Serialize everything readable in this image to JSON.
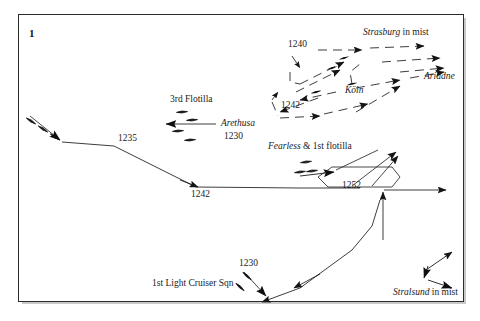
{
  "figure": {
    "panel_number": "1",
    "kind": "naval-track-chart",
    "background_color": "#ffffff",
    "ink_color": "#1a1a1a",
    "frame_color": "#2b2b2b"
  },
  "labels": [
    {
      "name": "label-1240",
      "text": "1240",
      "style": "time",
      "x": 288,
      "y": 44
    },
    {
      "name": "label-strasburg",
      "text": "Strasburg",
      "style": "ital",
      "x": 363,
      "y": 33,
      "suffix": " in mist"
    },
    {
      "name": "label-ariadne",
      "text": "Ariadne",
      "style": "ital",
      "x": 424,
      "y": 76
    },
    {
      "name": "label-koln",
      "text": "Köln",
      "style": "ital",
      "x": 345,
      "y": 90
    },
    {
      "name": "label-1242-upper",
      "text": "1242",
      "style": "time",
      "x": 281,
      "y": 105
    },
    {
      "name": "label-3rd-flotilla",
      "text": "3rd Flotilla",
      "style": "roman",
      "x": 170,
      "y": 99
    },
    {
      "name": "label-arethusa",
      "text": "Arethusa",
      "style": "ital",
      "x": 221,
      "y": 124
    },
    {
      "name": "label-arethusa-time",
      "text": "1230",
      "style": "time",
      "x": 224,
      "y": 136
    },
    {
      "name": "label-fearless",
      "text": "Fearless",
      "style": "ital",
      "x": 268,
      "y": 146,
      "suffix": " & 1st flotilla"
    },
    {
      "name": "label-1235",
      "text": "1235",
      "style": "time",
      "x": 118,
      "y": 138
    },
    {
      "name": "label-1242-lower",
      "text": "1242",
      "style": "time",
      "x": 191,
      "y": 194
    },
    {
      "name": "label-1252",
      "text": "1252",
      "style": "time",
      "x": 342,
      "y": 185
    },
    {
      "name": "label-1230-lcs",
      "text": "1230",
      "style": "time",
      "x": 239,
      "y": 263
    },
    {
      "name": "label-1st-lcs",
      "text": "1st Light Cruiser Sqn",
      "style": "roman",
      "x": 152,
      "y": 283
    },
    {
      "name": "label-stralsund",
      "text": "Stralsund",
      "style": "ital",
      "x": 393,
      "y": 292,
      "suffix": " in mist"
    }
  ],
  "tracks": {
    "british_main": "M28,120 L54,138 L114,146 L196,187 L232,188 L300,188 L378,188 L448,188",
    "british_1235_to_1242": "M114,146 L196,187",
    "lcs_south": "M262,303 L300,288 L330,275 L352,235 L356,200 L357,176",
    "lcs_to_loop": "M357,176 L362,160 L372,152",
    "loop_polygon": "M318,176 L326,186 L392,186 L398,176 L390,166 L330,166 Z",
    "vertical_1252": "M382,190 L382,232 L382,268",
    "fearless_line": "M300,170 L330,168 L372,152",
    "fearless_branch": "M330,168 L352,186 L396,152"
  },
  "ship_groups": [
    {
      "name": "arethusa-group",
      "count": 4
    },
    {
      "name": "fearless-group",
      "count": 3
    },
    {
      "name": "lcs-group",
      "count": 2
    },
    {
      "name": "british-lead",
      "count": 3
    }
  ],
  "legend_notes": {
    "solid_lines": "British tracks",
    "dashed_lines": "German cruiser tracks",
    "arrowheads": "direction of movement",
    "lens_marks": "ship symbols"
  }
}
